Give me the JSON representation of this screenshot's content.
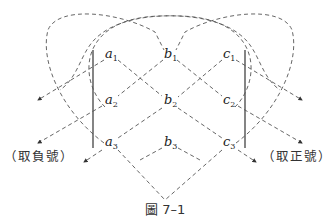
{
  "figure": {
    "caption": "圖 7–1",
    "topic": "Sarrus rule for 3x3 determinant",
    "matrix": [
      [
        {
          "letter": "a",
          "sub": "1"
        },
        {
          "letter": "b",
          "sub": "1"
        },
        {
          "letter": "c",
          "sub": "1"
        }
      ],
      [
        {
          "letter": "a",
          "sub": "2"
        },
        {
          "letter": "b",
          "sub": "2"
        },
        {
          "letter": "c",
          "sub": "2"
        }
      ],
      [
        {
          "letter": "a",
          "sub": "3"
        },
        {
          "letter": "b",
          "sub": "3"
        },
        {
          "letter": "c",
          "sub": "3"
        }
      ]
    ],
    "left_label": "（取負號）",
    "right_label": "（取正號）",
    "colors": {
      "stroke": "#555555",
      "text": "#222222",
      "background": "#ffffff"
    }
  }
}
